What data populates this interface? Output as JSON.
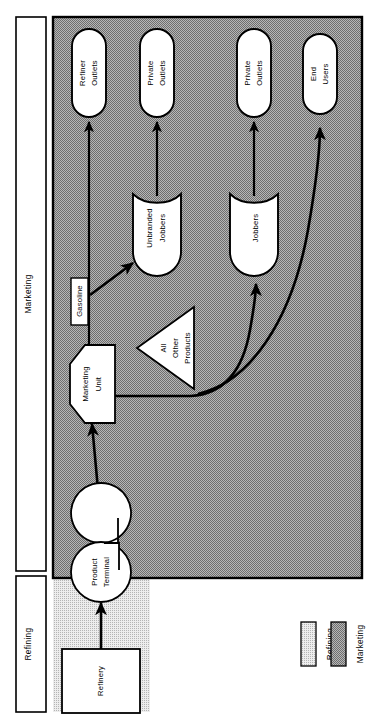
{
  "diagram": {
    "orientation": "rotated-90"
  },
  "side_labels": [
    {
      "name": "marketing-band-label",
      "text": "Marketing"
    },
    {
      "name": "refining-band-label",
      "text": "Refining"
    }
  ],
  "regions": {
    "marketing": {
      "label": "Marketing",
      "fill": "#9c9c9c",
      "border": "#000000"
    },
    "refining": {
      "label": "Refining",
      "fill": "#d8d8d8",
      "border": "none"
    }
  },
  "nodes": {
    "refinery": {
      "label": "Refinery",
      "shape": "rectangle"
    },
    "product_terminal": {
      "label_line1": "Product",
      "label_line2": "Terminal",
      "shape": "circle-notched"
    },
    "marketing_unit": {
      "label_line1": "Marketing",
      "label_line2": "Unit",
      "shape": "hexagon"
    },
    "gasoline": {
      "label": "Gasoline",
      "shape": "tag-rectangle"
    },
    "all_other_products": {
      "label_line1": "All",
      "label_line2": "Other",
      "label_line3": "Products",
      "shape": "triangle"
    },
    "unbranded_jobbers": {
      "label_line1": "Unbranded",
      "label_line2": "Jobbers",
      "shape": "shield"
    },
    "jobbers": {
      "label": "Jobbers",
      "shape": "shield"
    },
    "refiner_outlets": {
      "label_line1": "Refiner",
      "label_line2": "Outlets",
      "shape": "pill"
    },
    "private_outlets_a": {
      "label_line1": "Private",
      "label_line2": "Outlets",
      "shape": "pill"
    },
    "private_outlets_b": {
      "label_line1": "Private",
      "label_line2": "Outlets",
      "shape": "pill"
    },
    "end_users": {
      "label_line1": "End",
      "label_line2": "Users",
      "shape": "pill"
    }
  },
  "legend": {
    "items": [
      {
        "label": "Refining",
        "fill": "#d8d8d8",
        "border": "#000000"
      },
      {
        "label": "Marketing",
        "fill": "#9c9c9c",
        "border": "#000000"
      }
    ]
  },
  "edges": [
    {
      "from": "refinery",
      "to": "product_terminal"
    },
    {
      "from": "product_terminal",
      "to": "marketing_unit"
    },
    {
      "from": "marketing_unit",
      "to": "gasoline"
    },
    {
      "from": "gasoline",
      "to": "refiner_outlets"
    },
    {
      "from": "gasoline",
      "to": "unbranded_jobbers"
    },
    {
      "from": "unbranded_jobbers",
      "to": "private_outlets_a"
    },
    {
      "from": "marketing_unit",
      "to": "jobbers"
    },
    {
      "from": "jobbers",
      "to": "private_outlets_b"
    },
    {
      "from": "marketing_unit",
      "to": "end_users"
    }
  ]
}
